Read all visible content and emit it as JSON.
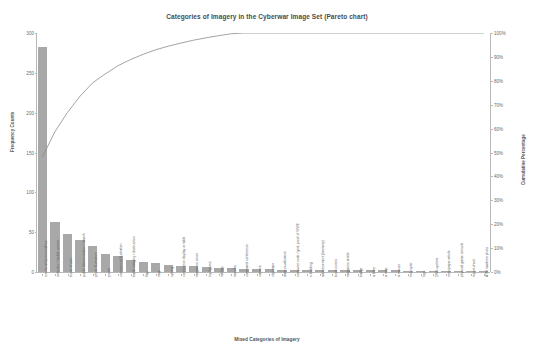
{
  "chart_data": {
    "type": "bar",
    "title": "Categories of Imagery in the Cyberwar Image Set (Pareto chart)",
    "xlabel": "Mixed Categories of Imagery",
    "ylabel": "Frequency Counts",
    "y2label": "Cumulative Percentage",
    "ylim": [
      0,
      300
    ],
    "y2lim": [
      0,
      100
    ],
    "yticks": [
      "0",
      "50",
      "100",
      "150",
      "200",
      "250",
      "300"
    ],
    "y2ticks": [
      "0%",
      "10%",
      "20%",
      "30%",
      "40%",
      "50%",
      "60%",
      "70%",
      "80%",
      "90%",
      "100%"
    ],
    "grid": false,
    "legend": "none",
    "bar_color": "#a8a8a8",
    "line_color": "#8c8c8c",
    "categories": [
      "events and personalities",
      "websites / mobile screen",
      "boots of user",
      "public demonstration / march",
      "photo illustration",
      "power",
      "commercial illustration",
      "battle imagery / destruction",
      "flag",
      "map",
      "cyborg",
      "conference display or table",
      "magazine cover",
      "toy figures",
      "military",
      "missiles",
      "command conference",
      "camera",
      "cityscape",
      "data visualization",
      "computer code / grid, proof of WWII",
      "e-building",
      "advertisement (memory)",
      "book covers",
      "magazine article",
      "badge",
      "a letter",
      "a map",
      "a mouse",
      "helicopter",
      "logo",
      "DNS system",
      "newspaper article",
      "physical game console",
      "report sheet",
      "ATM machine photo"
    ],
    "values": [
      283,
      63,
      48,
      40,
      33,
      22,
      20,
      15,
      13,
      11,
      9,
      8,
      7,
      6,
      5,
      5,
      4,
      4,
      4,
      3,
      3,
      3,
      3,
      2,
      2,
      2,
      2,
      2,
      2,
      1,
      1,
      1,
      1,
      1,
      1,
      1
    ],
    "cumulative_percentages": [
      48.0,
      58.7,
      66.8,
      73.6,
      79.2,
      82.9,
      86.3,
      88.9,
      91.1,
      93.0,
      94.5,
      95.8,
      97.0,
      98.0,
      98.9,
      99.7,
      100.0,
      100.0,
      100.0,
      100.0,
      100.0,
      100.0,
      100.0,
      100.0,
      100.0,
      100.0,
      100.0,
      100.0,
      100.0,
      100.0,
      100.0,
      100.0,
      100.0,
      100.0,
      100.0,
      100.0
    ]
  }
}
